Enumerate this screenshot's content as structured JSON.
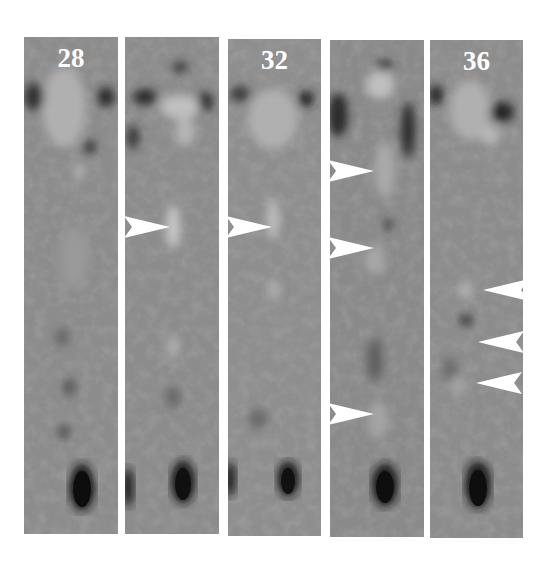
{
  "figure": {
    "background": "#ffffff",
    "panel_count": 5,
    "panels": [
      {
        "label": "28",
        "x": 24,
        "y": 37,
        "w": 94,
        "h": 497
      },
      {
        "label": "",
        "x": 125,
        "y": 37,
        "w": 94,
        "h": 497
      },
      {
        "label": "32",
        "x": 228,
        "y": 39,
        "w": 93,
        "h": 497
      },
      {
        "label": "",
        "x": 330,
        "y": 40,
        "w": 94,
        "h": 497
      },
      {
        "label": "36",
        "x": 430,
        "y": 40,
        "w": 93,
        "h": 498
      }
    ],
    "arrows": [
      {
        "panel": 2,
        "direction": "right",
        "x": 124,
        "y": 216
      },
      {
        "panel": 3,
        "direction": "right",
        "x": 226,
        "y": 216
      },
      {
        "panel": 4,
        "direction": "right",
        "x": 328,
        "y": 160
      },
      {
        "panel": 4,
        "direction": "right",
        "x": 328,
        "y": 237
      },
      {
        "panel": 4,
        "direction": "right",
        "x": 328,
        "y": 403
      },
      {
        "panel": 5,
        "direction": "left",
        "x": 483,
        "y": 279
      },
      {
        "panel": 5,
        "direction": "left",
        "x": 478,
        "y": 331
      },
      {
        "panel": 5,
        "direction": "left",
        "x": 476,
        "y": 372
      }
    ],
    "colors": {
      "panel_gray": "#8a8a8a",
      "label": "#ffffff",
      "arrow": "#ffffff",
      "dark_blob": "#1a1a1a"
    }
  }
}
